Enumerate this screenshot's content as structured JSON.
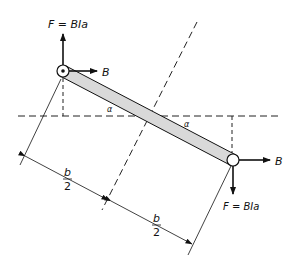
{
  "diagram": {
    "type": "physics-figure",
    "labels": {
      "force_top": "F = BIa",
      "force_bottom": "F = BIa",
      "field_top": "B",
      "field_bottom": "B",
      "angle_left": "α",
      "angle_right": "α",
      "half_width_left_num": "b",
      "half_width_left_den": "2",
      "half_width_right_num": "b",
      "half_width_right_den": "2"
    },
    "colors": {
      "line": "#111111",
      "bar_fill": "#d9d9d9",
      "dashed": "#222222"
    },
    "elements": [
      "conductor-top (current out of page, dot)",
      "conductor-bottom (current into page, open circle)",
      "loop-bar",
      "horizontal dashed reference line",
      "rotation axis dashed line",
      "vertical dashed projection lines",
      "dimension lines b/2 + b/2"
    ]
  }
}
